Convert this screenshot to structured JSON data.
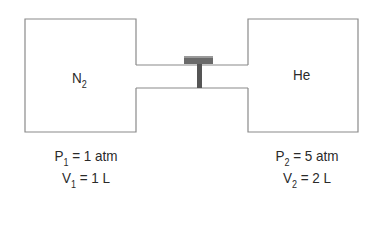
{
  "diagram": {
    "left_container": {
      "gas": "N",
      "gas_subscript": "2",
      "pressure_symbol": "P",
      "pressure_subscript": "1",
      "pressure_value": "= 1 atm",
      "volume_symbol": "V",
      "volume_subscript": "1",
      "volume_value": "= 1 L"
    },
    "right_container": {
      "gas": "He",
      "pressure_symbol": "P",
      "pressure_subscript": "2",
      "pressure_value": "= 5 atm",
      "volume_symbol": "V",
      "volume_subscript": "2",
      "volume_value": "= 2 L"
    },
    "connector": {
      "type": "tube",
      "valve": "closed stopcock"
    },
    "colors": {
      "line": "#8a8a8a",
      "valve": "#555555",
      "text": "#2a2a2a"
    }
  }
}
